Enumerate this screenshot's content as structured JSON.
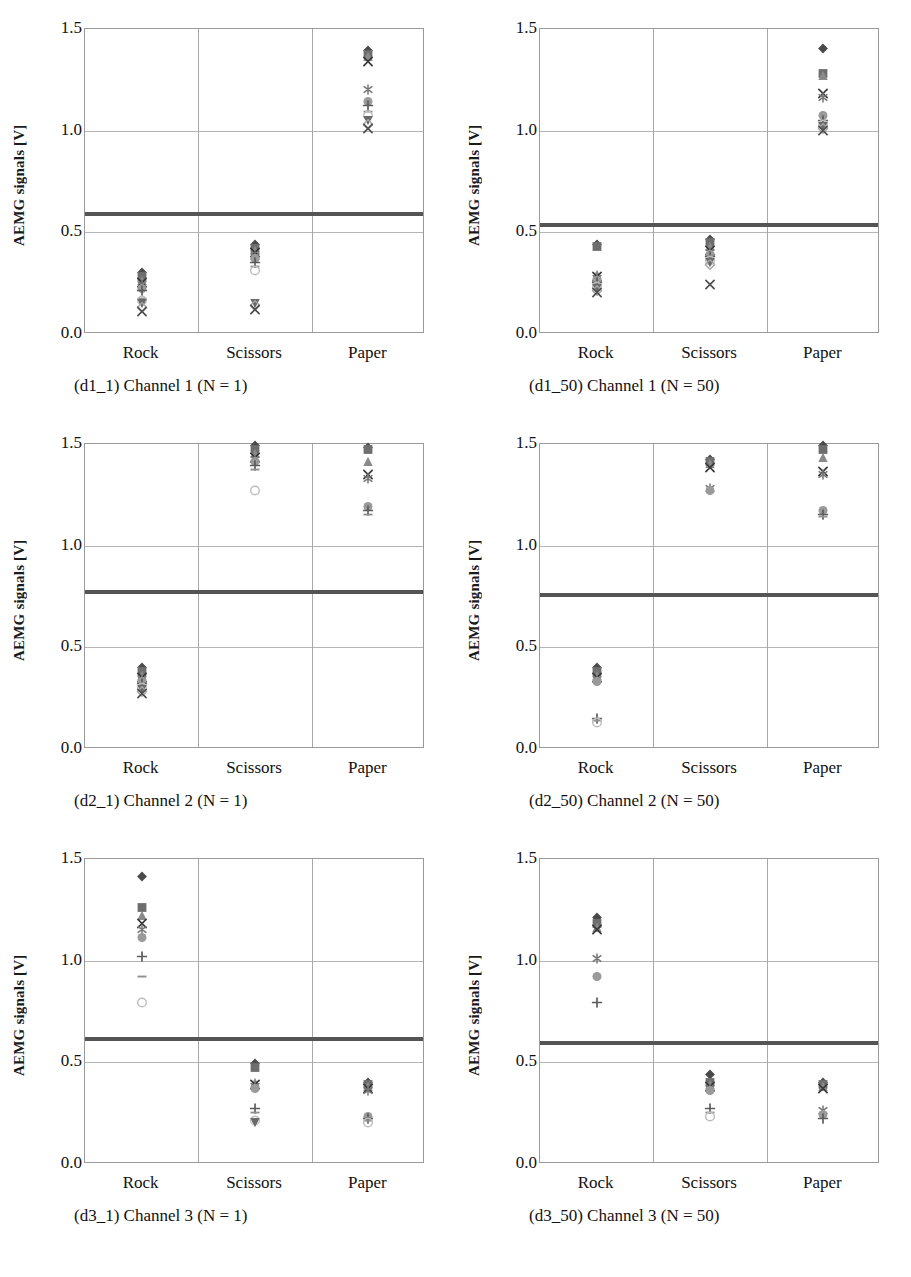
{
  "figure": {
    "yaxis_title": "AEMG signals [V]",
    "y_ticks": [
      "0.0",
      "0.5",
      "1.0",
      "1.5"
    ],
    "categories": [
      "Rock",
      "Scissors",
      "Paper"
    ]
  },
  "panels": [
    {
      "id": "d1_1",
      "caption": "(d1_1) Channel 1 (N = 1)",
      "channel": "Channel 1",
      "n": "1",
      "threshold": 0.59
    },
    {
      "id": "d1_50",
      "caption": "(d1_50) Channel 1 (N = 50)",
      "channel": "Channel 1",
      "n": "50",
      "threshold": 0.535
    },
    {
      "id": "d2_1",
      "caption": "(d2_1) Channel 2 (N = 1)",
      "channel": "Channel 2",
      "n": "1",
      "threshold": 0.77
    },
    {
      "id": "d2_50",
      "caption": "(d2_50) Channel 2 (N = 50)",
      "channel": "Channel 2",
      "n": "50",
      "threshold": 0.755
    },
    {
      "id": "d3_1",
      "caption": "(d3_1) Channel 3 (N = 1)",
      "channel": "Channel 3",
      "n": "1",
      "threshold": 0.615
    },
    {
      "id": "d3_50",
      "caption": "(d3_50) Channel 3 (N = 50)",
      "channel": "Channel 3",
      "n": "50",
      "threshold": 0.595
    }
  ],
  "chart_data": [
    {
      "id": "d1_1",
      "type": "scatter",
      "title": "(d1_1) Channel 1 (N = 1)",
      "xlabel": "",
      "ylabel": "AEMG signals [V]",
      "ylim": [
        0.0,
        1.5
      ],
      "categories": [
        "Rock",
        "Scissors",
        "Paper"
      ],
      "grid": true,
      "legend": "none",
      "threshold_line": 0.59,
      "series": [
        {
          "name": "Rock",
          "category_index": 0,
          "values": [
            0.3,
            0.28,
            0.26,
            0.25,
            0.24,
            0.22,
            0.21,
            0.17,
            0.16,
            0.15,
            0.13,
            0.11
          ]
        },
        {
          "name": "Scissors",
          "category_index": 1,
          "values": [
            0.44,
            0.42,
            0.41,
            0.4,
            0.38,
            0.37,
            0.35,
            0.33,
            0.31,
            0.15,
            0.14,
            0.12
          ]
        },
        {
          "name": "Paper",
          "category_index": 2,
          "values": [
            1.39,
            1.37,
            1.36,
            1.34,
            1.2,
            1.14,
            1.12,
            1.09,
            1.07,
            1.05,
            1.03,
            1.01
          ]
        }
      ]
    },
    {
      "id": "d1_50",
      "type": "scatter",
      "title": "(d1_50) Channel 1 (N = 50)",
      "xlabel": "",
      "ylabel": "AEMG signals [V]",
      "ylim": [
        0.0,
        1.5
      ],
      "categories": [
        "Rock",
        "Scissors",
        "Paper"
      ],
      "grid": true,
      "legend": "none",
      "threshold_line": 0.535,
      "series": [
        {
          "name": "Rock",
          "category_index": 0,
          "values": [
            0.44,
            0.43,
            0.29,
            0.28,
            0.27,
            0.26,
            0.25,
            0.24,
            0.23,
            0.22,
            0.21,
            0.2
          ]
        },
        {
          "name": "Scissors",
          "category_index": 1,
          "values": [
            0.46,
            0.45,
            0.43,
            0.41,
            0.4,
            0.39,
            0.38,
            0.37,
            0.36,
            0.35,
            0.34,
            0.24
          ]
        },
        {
          "name": "Paper",
          "category_index": 2,
          "values": [
            1.4,
            1.28,
            1.27,
            1.18,
            1.16,
            1.07,
            1.05,
            1.04,
            1.03,
            1.02,
            1.01,
            1.0
          ]
        }
      ]
    },
    {
      "id": "d2_1",
      "type": "scatter",
      "title": "(d2_1) Channel 2 (N = 1)",
      "xlabel": "",
      "ylabel": "AEMG signals [V]",
      "ylim": [
        0.0,
        1.5
      ],
      "categories": [
        "Rock",
        "Scissors",
        "Paper"
      ],
      "grid": true,
      "legend": "none",
      "threshold_line": 0.77,
      "series": [
        {
          "name": "Rock",
          "category_index": 0,
          "values": [
            0.4,
            0.38,
            0.36,
            0.35,
            0.34,
            0.33,
            0.32,
            0.31,
            0.3,
            0.29,
            0.28,
            0.27
          ]
        },
        {
          "name": "Scissors",
          "category_index": 1,
          "values": [
            1.49,
            1.47,
            1.45,
            1.43,
            1.42,
            1.41,
            1.39,
            1.37,
            1.27
          ]
        },
        {
          "name": "Paper",
          "category_index": 2,
          "values": [
            1.48,
            1.47,
            1.41,
            1.35,
            1.33,
            1.19,
            1.17,
            1.15
          ]
        }
      ]
    },
    {
      "id": "d2_50",
      "type": "scatter",
      "title": "(d2_50) Channel 2 (N = 50)",
      "xlabel": "",
      "ylabel": "AEMG signals [V]",
      "ylim": [
        0.0,
        1.5
      ],
      "categories": [
        "Rock",
        "Scissors",
        "Paper"
      ],
      "grid": true,
      "legend": "none",
      "threshold_line": 0.755,
      "series": [
        {
          "name": "Rock",
          "category_index": 0,
          "values": [
            0.4,
            0.38,
            0.36,
            0.35,
            0.34,
            0.33,
            0.15,
            0.14,
            0.13
          ]
        },
        {
          "name": "Scissors",
          "category_index": 1,
          "values": [
            1.42,
            1.41,
            1.4,
            1.38,
            1.28,
            1.27
          ]
        },
        {
          "name": "Paper",
          "category_index": 2,
          "values": [
            1.49,
            1.47,
            1.43,
            1.36,
            1.35,
            1.17,
            1.15,
            1.14
          ]
        }
      ]
    },
    {
      "id": "d3_1",
      "type": "scatter",
      "title": "(d3_1) Channel 3 (N = 1)",
      "xlabel": "",
      "ylabel": "AEMG signals [V]",
      "ylim": [
        0.0,
        1.5
      ],
      "categories": [
        "Rock",
        "Scissors",
        "Paper"
      ],
      "grid": true,
      "legend": "none",
      "threshold_line": 0.615,
      "series": [
        {
          "name": "Rock",
          "category_index": 0,
          "values": [
            1.41,
            1.26,
            1.22,
            1.18,
            1.15,
            1.11,
            1.02,
            0.92,
            0.79
          ]
        },
        {
          "name": "Scissors",
          "category_index": 1,
          "values": [
            0.49,
            0.47,
            0.4,
            0.39,
            0.38,
            0.37,
            0.27,
            0.25,
            0.21,
            0.2
          ]
        },
        {
          "name": "Paper",
          "category_index": 2,
          "values": [
            0.4,
            0.39,
            0.38,
            0.37,
            0.36,
            0.23,
            0.22,
            0.21,
            0.2
          ]
        }
      ]
    },
    {
      "id": "d3_50",
      "type": "scatter",
      "title": "(d3_50) Channel 3 (N = 50)",
      "xlabel": "",
      "ylabel": "AEMG signals [V]",
      "ylim": [
        0.0,
        1.5
      ],
      "categories": [
        "Rock",
        "Scissors",
        "Paper"
      ],
      "grid": true,
      "legend": "none",
      "threshold_line": 0.595,
      "series": [
        {
          "name": "Rock",
          "category_index": 0,
          "values": [
            1.21,
            1.18,
            1.16,
            1.15,
            1.01,
            0.92,
            0.79
          ]
        },
        {
          "name": "Scissors",
          "category_index": 1,
          "values": [
            0.44,
            0.4,
            0.39,
            0.38,
            0.37,
            0.36,
            0.27,
            0.25,
            0.23
          ]
        },
        {
          "name": "Paper",
          "category_index": 2,
          "values": [
            0.4,
            0.39,
            0.38,
            0.37,
            0.26,
            0.24,
            0.22
          ]
        }
      ]
    }
  ]
}
